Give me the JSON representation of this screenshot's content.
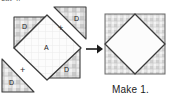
{
  "figure": {
    "type": "quilt-block-assembly-diagram",
    "title_fragment": "cut 4.",
    "caption": "Make 1.",
    "arrow": "right-arrow-icon",
    "operator": "+",
    "colors": {
      "outline": "#3b3b3b",
      "plaid_dark": "#b9b9b9",
      "plaid_light": "#dedede",
      "plaid_bg": "#f0f0f0",
      "center_fill": "#fbfbfb",
      "text": "#1b1b1b",
      "page_bg": "#ffffff"
    },
    "pieces": [
      {
        "id": "center-square-a",
        "label": "A",
        "shape": "square-on-point",
        "fabric": "light-solid"
      },
      {
        "id": "corner-triangle-top-left",
        "label": "D",
        "shape": "half-square-triangle",
        "fabric": "plaid"
      },
      {
        "id": "corner-triangle-bottom-right",
        "label": "D",
        "shape": "half-square-triangle",
        "fabric": "plaid"
      },
      {
        "id": "loose-triangle-top-right",
        "label": "D",
        "shape": "half-square-triangle",
        "fabric": "plaid"
      },
      {
        "id": "loose-triangle-bottom-left",
        "label": "D",
        "shape": "half-square-triangle",
        "fabric": "plaid"
      }
    ],
    "result": {
      "id": "finished-block",
      "shape": "square-in-a-square",
      "center_fabric": "light-solid",
      "corner_fabric": "plaid"
    }
  },
  "labels": {
    "a": "A",
    "d": "D",
    "plus": "+",
    "make": "Make 1.",
    "top_fragment": "cut 4."
  }
}
